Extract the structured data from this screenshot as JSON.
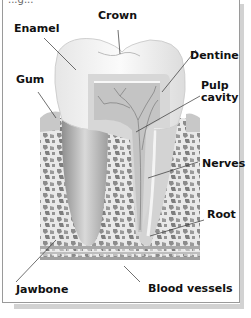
{
  "diagram": {
    "title_partial": "...g...",
    "labels": [
      {
        "id": "crown",
        "text": "Crown"
      },
      {
        "id": "enamel",
        "text": "Enamel"
      },
      {
        "id": "dentine",
        "text": "Dentine"
      },
      {
        "id": "gum",
        "text": "Gum"
      },
      {
        "id": "pulp-cavity",
        "text": "Pulp\ncavity",
        "line1": "Pulp",
        "line2": "cavity"
      },
      {
        "id": "nerves",
        "text": "Nerves"
      },
      {
        "id": "root",
        "text": "Root"
      },
      {
        "id": "jawbone",
        "text": "Jawbone"
      },
      {
        "id": "blood-vessels",
        "text": "Blood vessels"
      }
    ],
    "colors": {
      "background": "#ffffff",
      "border": "#9a9a9a",
      "shadow": "#d2d2d2",
      "tooth_enamel": "#f2f2f2",
      "dentine": "#d6d6d6",
      "pulp": "#bdbdbd",
      "bone": "#e8e8e8",
      "bone_holes": "#8a8a8a",
      "label_text": "#111111"
    }
  }
}
